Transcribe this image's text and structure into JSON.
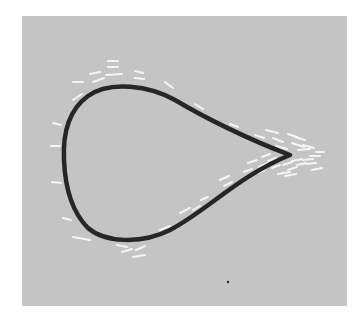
{
  "figure": {
    "background": "#ffffff",
    "panel": {
      "x": 22,
      "y": 16,
      "width": 325,
      "height": 290,
      "fill": "#c4c4c4"
    },
    "outline": {
      "stroke": "#262626",
      "width": 4.5,
      "path": "M 290 155 C 250 140, 205 118, 175 100 C 150 86, 110 80, 88 96 C 66 112, 63 140, 64 160 C 65 185, 70 210, 88 228 C 104 242, 140 245, 170 230 C 205 212, 240 175, 290 155 Z"
    },
    "dash_color": "#f4f4f4",
    "dashes": [
      [
        108,
        61,
        118,
        61
      ],
      [
        108,
        67,
        118,
        67
      ],
      [
        106,
        75,
        122,
        74
      ],
      [
        90,
        74,
        100,
        72
      ],
      [
        93,
        82,
        104,
        78
      ],
      [
        73,
        82,
        83,
        82
      ],
      [
        73,
        100,
        82,
        94
      ],
      [
        135,
        71,
        143,
        73
      ],
      [
        135,
        78,
        144,
        79
      ],
      [
        165,
        82,
        173,
        88
      ],
      [
        195,
        104,
        203,
        109
      ],
      [
        53,
        123,
        61,
        125
      ],
      [
        51,
        146,
        60,
        146
      ],
      [
        52,
        182,
        61,
        183
      ],
      [
        63,
        218,
        71,
        220
      ],
      [
        73,
        237,
        90,
        240
      ],
      [
        117,
        245,
        127,
        247
      ],
      [
        122,
        252,
        132,
        249
      ],
      [
        136,
        250,
        145,
        246
      ],
      [
        133,
        257,
        145,
        255
      ],
      [
        140,
        238,
        150,
        236
      ],
      [
        160,
        230,
        170,
        226
      ],
      [
        180,
        213,
        190,
        208
      ],
      [
        193,
        210,
        200,
        206
      ],
      [
        201,
        200,
        208,
        197
      ],
      [
        220,
        180,
        229,
        176
      ],
      [
        224,
        186,
        232,
        182
      ],
      [
        230,
        124,
        238,
        127
      ],
      [
        255,
        135,
        264,
        138
      ],
      [
        257,
        143,
        268,
        146
      ],
      [
        266,
        130,
        278,
        133
      ],
      [
        273,
        138,
        283,
        142
      ],
      [
        276,
        146,
        287,
        149
      ],
      [
        288,
        134,
        297,
        137
      ],
      [
        292,
        143,
        304,
        147
      ],
      [
        295,
        137,
        305,
        140
      ],
      [
        298,
        150,
        310,
        149
      ],
      [
        303,
        145,
        314,
        148
      ],
      [
        244,
        172,
        252,
        169
      ],
      [
        248,
        163,
        257,
        160
      ],
      [
        257,
        173,
        265,
        170
      ],
      [
        259,
        167,
        268,
        163
      ],
      [
        262,
        157,
        270,
        154
      ],
      [
        268,
        161,
        276,
        158
      ],
      [
        272,
        168,
        280,
        165
      ],
      [
        278,
        174,
        290,
        172
      ],
      [
        283,
        165,
        292,
        162
      ],
      [
        288,
        170,
        297,
        167
      ],
      [
        292,
        161,
        302,
        159
      ],
      [
        297,
        165,
        306,
        163
      ],
      [
        303,
        160,
        313,
        159
      ],
      [
        306,
        164,
        316,
        163
      ],
      [
        310,
        156,
        320,
        156
      ],
      [
        312,
        170,
        322,
        168
      ],
      [
        316,
        152,
        324,
        152
      ],
      [
        285,
        176,
        296,
        174
      ]
    ],
    "dot": {
      "cx": 228,
      "cy": 282,
      "r": 1.2,
      "fill": "#222222"
    }
  }
}
